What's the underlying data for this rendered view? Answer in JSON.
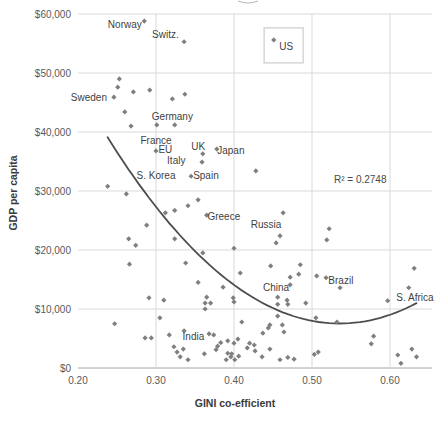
{
  "chart_data": {
    "type": "scatter",
    "title": "",
    "xlabel": "GINI co-efficient",
    "ylabel": "GDP per capita",
    "xlim": [
      0.2,
      0.654
    ],
    "ylim": [
      0,
      60000
    ],
    "grid": true,
    "x_ticks": [
      {
        "value": 0.2,
        "label": "0.20"
      },
      {
        "value": 0.3,
        "label": "0.30"
      },
      {
        "value": 0.4,
        "label": "0.40"
      },
      {
        "value": 0.5,
        "label": "0.50"
      },
      {
        "value": 0.6,
        "label": "0.60"
      }
    ],
    "y_ticks": [
      {
        "value": 0,
        "label": "$0"
      },
      {
        "value": 10000,
        "label": "$10,000"
      },
      {
        "value": 20000,
        "label": "$20,000"
      },
      {
        "value": 30000,
        "label": "$30,000"
      },
      {
        "value": 40000,
        "label": "$40,000"
      },
      {
        "value": 50000,
        "label": "$50,000"
      },
      {
        "value": 60000,
        "label": "$60,000"
      }
    ],
    "marker": {
      "shape": "diamond",
      "color": "#7f7f7f",
      "size": 5.2
    },
    "colors": {
      "gridline": "#d9d9d9",
      "zero_axis": "#a6a6a6",
      "trendline": "#4d4d4d",
      "marker": "#7f7f7f",
      "label_box_border": "#d6d6d6"
    },
    "points": [
      [
        0.285,
        58800
      ],
      [
        0.336,
        55300
      ],
      [
        0.451,
        55600
      ],
      [
        0.253,
        49000
      ],
      [
        0.251,
        47600
      ],
      [
        0.271,
        46800
      ],
      [
        0.292,
        47100
      ],
      [
        0.246,
        45900
      ],
      [
        0.337,
        46400
      ],
      [
        0.321,
        45600
      ],
      [
        0.26,
        43400
      ],
      [
        0.268,
        41000
      ],
      [
        0.301,
        41200
      ],
      [
        0.324,
        41200
      ],
      [
        0.3,
        36800
      ],
      [
        0.36,
        36300
      ],
      [
        0.378,
        37100
      ],
      [
        0.359,
        34900
      ],
      [
        0.345,
        32500
      ],
      [
        0.428,
        33400
      ],
      [
        0.238,
        30800
      ],
      [
        0.262,
        29500
      ],
      [
        0.354,
        28500
      ],
      [
        0.341,
        27500
      ],
      [
        0.324,
        26700
      ],
      [
        0.312,
        26300
      ],
      [
        0.365,
        25900
      ],
      [
        0.288,
        24200
      ],
      [
        0.463,
        26300
      ],
      [
        0.459,
        22400
      ],
      [
        0.454,
        21200
      ],
      [
        0.522,
        23600
      ],
      [
        0.519,
        21700
      ],
      [
        0.324,
        21900
      ],
      [
        0.265,
        21900
      ],
      [
        0.274,
        20800
      ],
      [
        0.4,
        20300
      ],
      [
        0.36,
        19500
      ],
      [
        0.266,
        17600
      ],
      [
        0.338,
        17800
      ],
      [
        0.354,
        14500
      ],
      [
        0.386,
        13700
      ],
      [
        0.408,
        16100
      ],
      [
        0.447,
        17300
      ],
      [
        0.485,
        17500
      ],
      [
        0.483,
        15900
      ],
      [
        0.472,
        15400
      ],
      [
        0.472,
        14100
      ],
      [
        0.506,
        15600
      ],
      [
        0.518,
        15300
      ],
      [
        0.536,
        13600
      ],
      [
        0.631,
        16900
      ],
      [
        0.624,
        13600
      ],
      [
        0.597,
        11400
      ],
      [
        0.291,
        11900
      ],
      [
        0.31,
        11500
      ],
      [
        0.365,
        12000
      ],
      [
        0.363,
        11000
      ],
      [
        0.37,
        11000
      ],
      [
        0.363,
        10000
      ],
      [
        0.399,
        11900
      ],
      [
        0.4,
        11200
      ],
      [
        0.456,
        12000
      ],
      [
        0.456,
        10800
      ],
      [
        0.468,
        11500
      ],
      [
        0.469,
        10800
      ],
      [
        0.492,
        11000
      ],
      [
        0.305,
        8500
      ],
      [
        0.247,
        7500
      ],
      [
        0.41,
        7800
      ],
      [
        0.456,
        8800
      ],
      [
        0.505,
        8500
      ],
      [
        0.532,
        7800
      ],
      [
        0.444,
        6800
      ],
      [
        0.446,
        7300
      ],
      [
        0.462,
        7300
      ],
      [
        0.464,
        6100
      ],
      [
        0.437,
        5900
      ],
      [
        0.579,
        5400
      ],
      [
        0.576,
        4100
      ],
      [
        0.286,
        5100
      ],
      [
        0.294,
        5100
      ],
      [
        0.317,
        5600
      ],
      [
        0.336,
        6300
      ],
      [
        0.368,
        5800
      ],
      [
        0.374,
        5600
      ],
      [
        0.405,
        4900
      ],
      [
        0.392,
        4600
      ],
      [
        0.4,
        4200
      ],
      [
        0.42,
        4200
      ],
      [
        0.426,
        3900
      ],
      [
        0.417,
        3400
      ],
      [
        0.427,
        2900
      ],
      [
        0.446,
        3200
      ],
      [
        0.323,
        3600
      ],
      [
        0.327,
        2700
      ],
      [
        0.335,
        3200
      ],
      [
        0.331,
        1900
      ],
      [
        0.341,
        1400
      ],
      [
        0.362,
        2400
      ],
      [
        0.377,
        3100
      ],
      [
        0.379,
        3700
      ],
      [
        0.383,
        4300
      ],
      [
        0.396,
        1900
      ],
      [
        0.39,
        1400
      ],
      [
        0.401,
        1400
      ],
      [
        0.392,
        2500
      ],
      [
        0.397,
        2400
      ],
      [
        0.406,
        2000
      ],
      [
        0.436,
        1900
      ],
      [
        0.459,
        1400
      ],
      [
        0.469,
        1800
      ],
      [
        0.477,
        1500
      ],
      [
        0.503,
        2300
      ],
      [
        0.508,
        2700
      ],
      [
        0.61,
        2200
      ],
      [
        0.614,
        800
      ],
      [
        0.628,
        3200
      ],
      [
        0.634,
        1900
      ]
    ],
    "country_labels": [
      {
        "text": "Norway",
        "pos": [
          0.26,
          58300
        ]
      },
      {
        "text": "Switz.",
        "pos": [
          0.312,
          56600
        ]
      },
      {
        "text": "Sweden",
        "pos": [
          0.214,
          45900
        ]
      },
      {
        "text": "Germany",
        "pos": [
          0.321,
          42700
        ]
      },
      {
        "text": "France",
        "pos": [
          0.3,
          38600
        ]
      },
      {
        "text": "EU",
        "pos": [
          0.312,
          37100
        ]
      },
      {
        "text": "UK",
        "pos": [
          0.354,
          37600
        ]
      },
      {
        "text": "Japan",
        "pos": [
          0.396,
          36900
        ]
      },
      {
        "text": "Italy",
        "pos": [
          0.326,
          35100
        ]
      },
      {
        "text": "S. Korea",
        "pos": [
          0.3,
          32700
        ]
      },
      {
        "text": "Spain",
        "pos": [
          0.364,
          32700
        ]
      },
      {
        "text": "Greece",
        "pos": [
          0.387,
          25600
        ]
      },
      {
        "text": "Russia",
        "pos": [
          0.441,
          24400
        ]
      },
      {
        "text": "China",
        "pos": [
          0.454,
          13700
        ]
      },
      {
        "text": "Brazil",
        "pos": [
          0.537,
          14900
        ]
      },
      {
        "text": "S. Africa",
        "pos": [
          0.632,
          12000
        ]
      },
      {
        "text": "India",
        "pos": [
          0.348,
          5400
        ]
      }
    ],
    "us_label": {
      "text": "US",
      "pos": [
        0.463,
        54600
      ],
      "boxed": true
    },
    "trendline": {
      "type": "polynomial",
      "degree": 2,
      "a": 356600,
      "vertex_x": 0.5355,
      "vertex_y": 7540,
      "x_start": 0.238,
      "x_end": 0.634,
      "r_squared": 0.2748,
      "r_squared_label": "R² = 0.2748",
      "r_squared_pos": [
        0.558,
        31900
      ]
    }
  }
}
